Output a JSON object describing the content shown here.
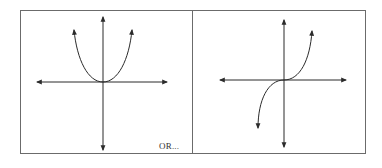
{
  "panels": [
    {
      "name": "even-power-graph",
      "curve": "parabola-like U shape through origin"
    },
    {
      "name": "odd-power-graph",
      "curve": "cubic-like S shape through origin"
    }
  ],
  "label": "OR...",
  "colors": {
    "stroke": "#2b2b2b",
    "border": "#6b6b6b"
  }
}
